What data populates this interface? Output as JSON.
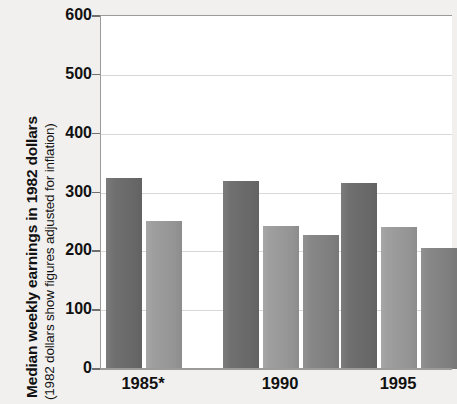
{
  "chart_data": {
    "type": "bar",
    "title": "",
    "subtitle": "",
    "ylabel": "Median weekly earnings in 1982 dollars",
    "ylabel_note": "(1982 dollars show figures adjusted for inflation)",
    "xlabel": "",
    "categories": [
      "1985*",
      "1990",
      "1995"
    ],
    "ylim": [
      0,
      600
    ],
    "ytick_labels": [
      "600",
      "500",
      "400",
      "300",
      "200",
      "100",
      "0"
    ],
    "ytick_values": [
      600,
      500,
      400,
      300,
      200,
      100,
      0
    ],
    "grid": true,
    "grid_axis": "y",
    "legend": "none",
    "series": [
      {
        "name": "series-1",
        "color": "#6d6d6d",
        "values": [
          324,
          320,
          317
        ]
      },
      {
        "name": "series-2",
        "color": "#9c9c9c",
        "values": [
          251,
          243,
          241
        ]
      },
      {
        "name": "series-3",
        "color": "#858585",
        "values": [
          null,
          228,
          205
        ]
      }
    ],
    "colors": {
      "background": "#f1f0ee",
      "plot_background": "#ffffff",
      "gridline": "#d8d8d8",
      "axis": "#9a9a9a",
      "text": "#111111"
    }
  }
}
